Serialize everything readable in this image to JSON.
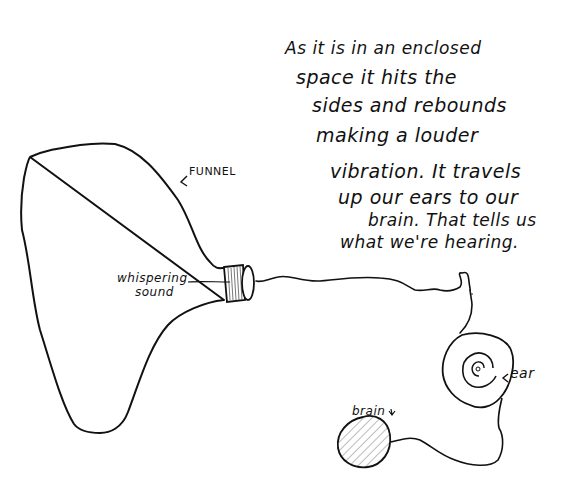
{
  "diagram": {
    "title": "",
    "explanation_lines": [
      "As it is  in an enclosed",
      "space it hits the",
      "sides and rebounds",
      "making a louder",
      "vibration. It travels",
      "up our ears to our",
      "brain. That tells us",
      "what we're hearing."
    ],
    "labels": {
      "funnel": "FUNNEL",
      "sound_line1": "whispering",
      "sound_line2": "sound",
      "ear": "ear",
      "brain": "brain"
    },
    "nodes": [
      {
        "id": "funnel",
        "label": "FUNNEL",
        "shape": "large cone outline"
      },
      {
        "id": "funnel-neck",
        "label": "",
        "shape": "hatched cylinder"
      },
      {
        "id": "ear",
        "label": "ear",
        "shape": "spiral"
      },
      {
        "id": "brain",
        "label": "brain",
        "shape": "hatched circle"
      }
    ],
    "edges": [
      {
        "from": "funnel-neck",
        "to": "ear",
        "style": "wavy line"
      },
      {
        "from": "ear",
        "to": "brain",
        "style": "curved line"
      }
    ],
    "colors": {
      "ink": "#111111",
      "paper": "#ffffff",
      "hatch": "#777777"
    }
  }
}
